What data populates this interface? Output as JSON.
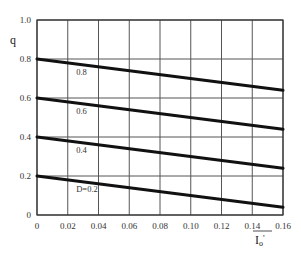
{
  "chart_data": {
    "type": "line",
    "title": "",
    "xlabel": "I_o'",
    "ylabel": "q",
    "xlim": [
      0,
      0.16
    ],
    "ylim": [
      0,
      1.0
    ],
    "grid": true,
    "legend": "inline labels",
    "x_ticks": [
      "0",
      "0.02",
      "0.04",
      "0.06",
      "0.08",
      "0.10",
      "0.12",
      "0.14",
      "0.16"
    ],
    "y_ticks": [
      "0",
      "0.2",
      "0.4",
      "0.6",
      "0.8",
      "1.0"
    ],
    "x": [
      0,
      0.16
    ],
    "series": [
      {
        "name": "0.8",
        "label": "0.8",
        "values": [
          0.8,
          0.64
        ]
      },
      {
        "name": "0.6",
        "label": "0.6",
        "values": [
          0.6,
          0.44
        ]
      },
      {
        "name": "0.4",
        "label": "0.4",
        "values": [
          0.4,
          0.24
        ]
      },
      {
        "name": "0.2",
        "label": "D=0.2",
        "values": [
          0.2,
          0.04
        ]
      }
    ]
  },
  "style": {
    "grid_color": "#555555",
    "line_color": "#111111",
    "background": "#ffffff"
  }
}
